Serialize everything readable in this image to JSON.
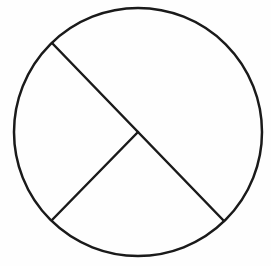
{
  "diagram": {
    "type": "circle-sectors",
    "canvas": {
      "width": 271,
      "height": 266
    },
    "background_color": "#ffffff",
    "stroke_color": "#1a1a1a",
    "stroke_width": 2.5,
    "circle": {
      "cx": 138,
      "cy": 132,
      "r": 124
    },
    "segments": [
      {
        "name": "diameter",
        "x1": 52,
        "y1": 43,
        "x2": 224,
        "y2": 221
      },
      {
        "name": "radius",
        "x1": 138,
        "y1": 132,
        "x2": 52,
        "y2": 220
      }
    ],
    "center_point": {
      "x": 138,
      "y": 132
    },
    "regions": 3,
    "labels": []
  }
}
